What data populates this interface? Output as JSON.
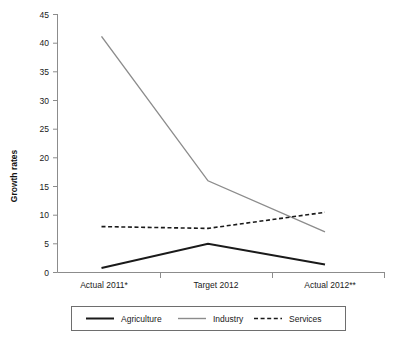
{
  "chart_data": {
    "type": "line",
    "title": "",
    "xlabel": "",
    "ylabel": "Growth rates",
    "categories": [
      "Actual 2011*",
      "Target 2012",
      "Actual 2012**"
    ],
    "ylim": [
      0,
      45
    ],
    "yticks": [
      0,
      5,
      10,
      15,
      20,
      25,
      30,
      35,
      40,
      45
    ],
    "ytick_labels": [
      "0",
      "5",
      "10",
      "15",
      "20",
      "25",
      "30",
      "35",
      "40",
      "45"
    ],
    "grid": false,
    "legend_position": "bottom",
    "series": [
      {
        "name": "Agriculture",
        "values": [
          0.8,
          5.0,
          1.4
        ],
        "color": "#1a1a1a",
        "style": "solid",
        "width": 2
      },
      {
        "name": "Industry",
        "values": [
          41.2,
          16.0,
          7.1
        ],
        "color": "#8c8c8c",
        "style": "solid",
        "width": 1.4
      },
      {
        "name": "Services",
        "values": [
          8.0,
          7.7,
          10.5
        ],
        "color": "#1a1a1a",
        "style": "dashed",
        "width": 1.6
      }
    ]
  },
  "axis": {
    "y_title": "Growth rates"
  },
  "legend": {
    "items": [
      {
        "label": "Agriculture"
      },
      {
        "label": "Industry"
      },
      {
        "label": "Services"
      }
    ]
  },
  "colors": {
    "agriculture": "#1a1a1a",
    "industry": "#8c8c8c",
    "services": "#1a1a1a",
    "axis": "#8c8c8c",
    "background": "#ffffff"
  }
}
